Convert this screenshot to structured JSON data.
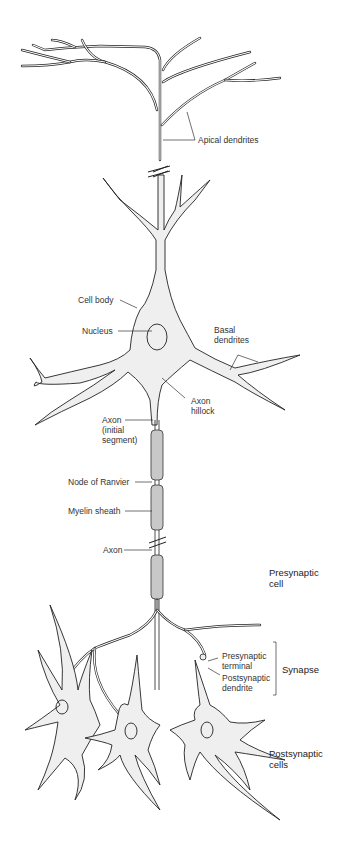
{
  "diagram": {
    "labels": {
      "apical_dendrites": "Apical dendrites",
      "cell_body": "Cell body",
      "nucleus": "Nucleus",
      "basal_dendrites": "Basal\ndendrites",
      "axon_hillock": "Axon\nhillock",
      "axon_initial_segment": "Axon\n(initial\nsegment)",
      "node_of_ranvier": "Node of Ranvier",
      "myelin_sheath": "Myelin sheath",
      "axon": "Axon",
      "presynaptic_cell": "Presynaptic\ncell",
      "presynaptic_terminal": "Presynaptic\nterminal",
      "postsynaptic_dendrite": "Postsynaptic\ndendrite",
      "synapse": "Synapse",
      "postsynaptic_cells": "Postsynaptic\ncells"
    },
    "colors": {
      "cell_fill": "#efefef",
      "myelin_fill": "#c8c8c8",
      "outline": "#222222"
    }
  }
}
